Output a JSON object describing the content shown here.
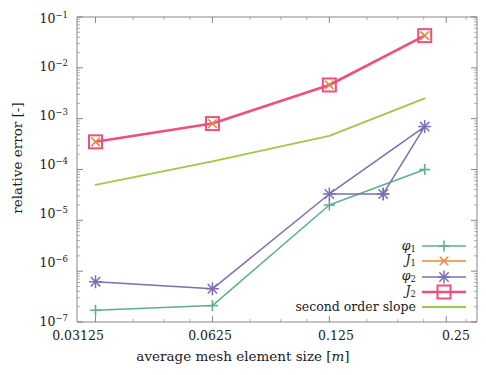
{
  "chart_data": {
    "type": "line",
    "title": "",
    "xlabel": "average mesh element size [m]",
    "ylabel": "relative error [-]",
    "xscale": "log2",
    "yscale": "log10",
    "xlim": [
      0.028,
      0.3
    ],
    "ylim": [
      1e-07,
      0.1
    ],
    "grid": false,
    "legend_position": "bottom-right",
    "xticks": [
      "0.03125",
      "0.0625",
      "0.125",
      "0.25"
    ],
    "xtick_values": [
      0.03125,
      0.0625,
      0.125,
      0.25
    ],
    "yticks": [
      "10-1",
      "10-2",
      "10-3",
      "10-4",
      "10-5",
      "10-6",
      "10-7"
    ],
    "ytick_values": [
      0.1,
      0.01,
      0.001,
      0.0001,
      1e-05,
      1e-06,
      1e-07
    ],
    "x": [
      0.03125,
      0.0625,
      0.125,
      0.22
    ],
    "series": [
      {
        "name": "phi1",
        "label": "φ",
        "sub": "1",
        "color": "#5fae8d",
        "marker": "plus",
        "values": [
          1.7e-07,
          2.1e-07,
          2e-05,
          0.0001
        ]
      },
      {
        "name": "J1",
        "label": "J",
        "sub": "1",
        "color": "#e8893c",
        "marker": "x",
        "values": [
          0.00035,
          0.0008,
          0.0046,
          0.043
        ]
      },
      {
        "name": "phi2",
        "label": "φ",
        "sub": "2",
        "color": "#7b6fb5",
        "marker": "asterisk",
        "values": [
          6.2e-07,
          4.5e-07,
          3.3e-05,
          0.0007
        ]
      },
      {
        "name": "J2",
        "label": "J",
        "sub": "2",
        "color": "#ee4f7f",
        "marker": "square",
        "values": [
          0.00035,
          0.0008,
          0.0046,
          0.043
        ]
      },
      {
        "name": "second_order_slope",
        "label": "second order slope",
        "sub": "",
        "color": "#9dc94a",
        "marker": "none",
        "values": [
          5e-05,
          0.000145,
          0.00046,
          0.0025
        ]
      }
    ],
    "phi2_extra_point": {
      "x": 0.172,
      "y": 3.3e-05,
      "note": "additional asterisk marker on phi2 line"
    },
    "legend_entries": [
      {
        "text": "φ1",
        "color": "#5fae8d",
        "marker": "plus"
      },
      {
        "text": "J1",
        "color": "#e8893c",
        "marker": "x"
      },
      {
        "text": "φ2",
        "color": "#7b6fb5",
        "marker": "asterisk"
      },
      {
        "text": "J2",
        "color": "#ee4f7f",
        "marker": "square"
      },
      {
        "text": "second order slope",
        "color": "#9dc94a",
        "marker": "none"
      }
    ]
  },
  "axes": {
    "ylabel": "relative error [-]",
    "xlabel_prefix": "average mesh element size [",
    "xlabel_unit": "m",
    "xlabel_suffix": "]",
    "ytick_0": "10",
    "ytick_0_exp": "−1",
    "ytick_1": "10",
    "ytick_1_exp": "−2",
    "ytick_2": "10",
    "ytick_2_exp": "−3",
    "ytick_3": "10",
    "ytick_3_exp": "−4",
    "ytick_4": "10",
    "ytick_4_exp": "−5",
    "ytick_5": "10",
    "ytick_5_exp": "−6",
    "ytick_6": "10",
    "ytick_6_exp": "−7",
    "xtick_0": "0.03125",
    "xtick_1": "0.0625",
    "xtick_2": "0.125",
    "xtick_3": "0.25"
  },
  "legend": {
    "e0_sym": "φ",
    "e0_sub": "1",
    "e1_sym": "J",
    "e1_sub": "1",
    "e2_sym": "φ",
    "e2_sub": "2",
    "e3_sym": "J",
    "e3_sub": "2",
    "e4_text": "second order slope"
  }
}
